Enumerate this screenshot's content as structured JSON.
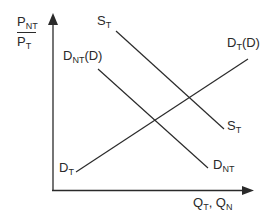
{
  "diagram": {
    "type": "supply-demand",
    "colors": {
      "line": "#2a2a2a",
      "background": "#ffffff"
    },
    "y_axis": {
      "label_numerator": {
        "base": "P",
        "sub": "NT"
      },
      "label_denominator": {
        "base": "P",
        "sub": "T"
      }
    },
    "x_axis": {
      "label_part1": {
        "base": "Q",
        "sub": "T"
      },
      "separator": ", ",
      "label_part2": {
        "base": "Q",
        "sub": "N"
      }
    },
    "curves": [
      {
        "id": "S_T",
        "label_base": "S",
        "label_sub": "T",
        "label_suffix": "",
        "x1": 116,
        "y1": 31,
        "x2": 224,
        "y2": 129,
        "end_label_base": "S",
        "end_label_sub": "T"
      },
      {
        "id": "D_NT",
        "label_base": "D",
        "label_sub": "NT",
        "label_suffix": "(D)",
        "x1": 98,
        "y1": 69,
        "x2": 208,
        "y2": 168,
        "end_label_base": "D",
        "end_label_sub": "NT"
      },
      {
        "id": "D_T",
        "label_base": "D",
        "label_sub": "T",
        "label_suffix": "(D)",
        "x1": 76,
        "y1": 172,
        "x2": 248,
        "y2": 59,
        "end_label_base": "D",
        "end_label_sub": "T"
      }
    ]
  }
}
